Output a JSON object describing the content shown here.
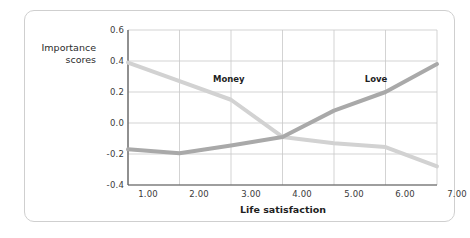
{
  "figure": {
    "background_color": "#ffffff",
    "border_color": "#cfcfcf"
  },
  "chart_data": {
    "type": "line",
    "title": "",
    "xlabel": "Life satisfaction",
    "ylabel": "Importance scores",
    "x": [
      1,
      2,
      3,
      4,
      5,
      6,
      7
    ],
    "xticklabels": [
      "1.00",
      "2.00",
      "3.00",
      "4.00",
      "5.00",
      "6.00",
      "7.00"
    ],
    "yticklabels": [
      "0.6",
      "0.4",
      "0.2",
      "0.0",
      "-0.2",
      "-0.4"
    ],
    "ytickvalues": [
      0.6,
      0.4,
      0.2,
      0.0,
      -0.2,
      -0.4
    ],
    "xlim": [
      1,
      7
    ],
    "ylim": [
      -0.4,
      0.6
    ],
    "grid": true,
    "legend": "inline-labels",
    "series": [
      {
        "name": "Money",
        "color": "#d2d2d2",
        "label_x": 3.0,
        "label_y": 0.28,
        "values": [
          0.39,
          0.27,
          0.15,
          -0.09,
          -0.13,
          -0.155,
          -0.28
        ]
      },
      {
        "name": "Love",
        "color": "#a9a9a9",
        "label_x": 5.85,
        "label_y": 0.28,
        "values": [
          -0.17,
          -0.195,
          -0.145,
          -0.09,
          0.08,
          0.2,
          0.38
        ]
      }
    ]
  }
}
